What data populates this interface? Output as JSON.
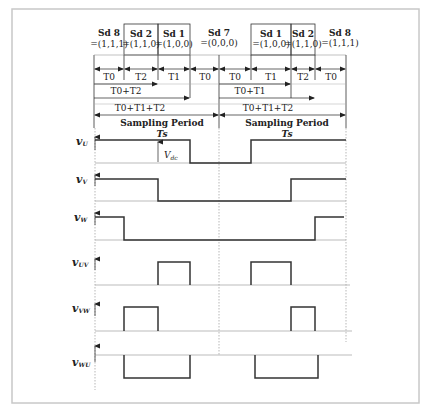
{
  "diagram": {
    "states": [
      {
        "id": "sd8a",
        "name": "Sd 8",
        "vector": "=(1,1,1)"
      },
      {
        "id": "sd2a",
        "name": "Sd 2",
        "vector": "=(1,1,0)"
      },
      {
        "id": "sd1a",
        "name": "Sd 1",
        "vector": "=(1,0,0)"
      },
      {
        "id": "sd7",
        "name": "Sd 7",
        "vector": "=(0,0,0)"
      },
      {
        "id": "sd1b",
        "name": "Sd 1",
        "vector": "=(1,0,0)"
      },
      {
        "id": "sd2b",
        "name": "Sd 2",
        "vector": "=(1,1,0)"
      },
      {
        "id": "sd8b",
        "name": "Sd 8",
        "vector": "=(1,1,1)"
      }
    ],
    "intervals_row1": [
      "T0",
      "T2",
      "T1",
      "T0",
      "T0",
      "T1",
      "T2",
      "T0"
    ],
    "cumulative_left": [
      "T0+T2",
      "T0+T1+T2"
    ],
    "cumulative_right": [
      "T0+T1",
      "T0+T1+T2"
    ],
    "period_label": "Sampling Period",
    "period_symbol": "Ts",
    "vdc_label": "V",
    "vdc_sub": "dc",
    "signals": [
      {
        "name": "v",
        "sub": "U"
      },
      {
        "name": "v",
        "sub": "V"
      },
      {
        "name": "v",
        "sub": "W"
      },
      {
        "name": "v",
        "sub": "UV"
      },
      {
        "name": "v",
        "sub": "VW"
      },
      {
        "name": "v",
        "sub": "WU"
      }
    ]
  }
}
